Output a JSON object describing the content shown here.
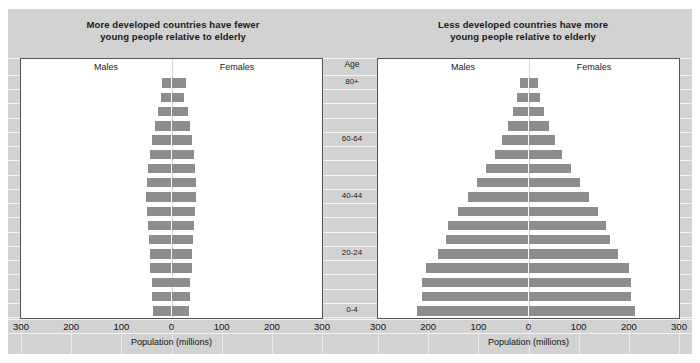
{
  "chart_data": {
    "type": "bar",
    "subtype": "population-pyramid",
    "panels": [
      {
        "id": "more-developed",
        "title_line1": "More developed countries have fewer",
        "title_line2": "young people relative to elderly",
        "male_label": "Males",
        "female_label": "Females",
        "xlabel": "Population (millions)",
        "xlim": [
          -300,
          300
        ],
        "xticks": [
          300,
          200,
          100,
          0,
          100,
          200,
          300
        ],
        "categories": [
          "0-4",
          "5-9",
          "10-14",
          "15-19",
          "20-24",
          "25-29",
          "30-34",
          "35-39",
          "40-44",
          "45-49",
          "50-54",
          "55-59",
          "60-64",
          "65-69",
          "70-74",
          "75-79",
          "80+"
        ],
        "series": [
          {
            "name": "Males",
            "values": [
              36,
              38,
              39,
              42,
              43,
              44,
              46,
              48,
              50,
              48,
              46,
              42,
              38,
              32,
              27,
              20,
              19
            ]
          },
          {
            "name": "Females",
            "values": [
              34,
              36,
              37,
              40,
              41,
              42,
              44,
              46,
              49,
              48,
              47,
              44,
              41,
              36,
              32,
              25,
              28
            ]
          }
        ]
      },
      {
        "id": "less-developed",
        "title_line1": "Less developed countries have more",
        "title_line2": "young people relative to elderly",
        "male_label": "Males",
        "female_label": "Females",
        "xlabel": "Population (millions)",
        "xlim": [
          -300,
          300
        ],
        "xticks": [
          300,
          200,
          100,
          0,
          100,
          200,
          300
        ],
        "categories": [
          "0-4",
          "5-9",
          "10-14",
          "15-19",
          "20-24",
          "25-29",
          "30-34",
          "35-39",
          "40-44",
          "45-49",
          "50-54",
          "55-59",
          "60-64",
          "65-69",
          "70-74",
          "75-79",
          "80+"
        ],
        "series": [
          {
            "name": "Males",
            "values": [
              222,
              212,
              212,
              205,
              180,
              165,
              160,
              140,
              120,
              103,
              85,
              67,
              52,
              40,
              30,
              22,
              17
            ]
          },
          {
            "name": "Females",
            "values": [
              213,
              205,
              205,
              200,
              178,
              163,
              155,
              138,
              120,
              103,
              84,
              66,
              52,
              40,
              30,
              22,
              19
            ]
          }
        ]
      }
    ],
    "age_axis": {
      "header": "Age",
      "labeled_ticks": [
        "0-4",
        "20-24",
        "40-44",
        "60-64",
        "80+"
      ]
    },
    "colors": {
      "bar": "#8d8d8d",
      "panel_background": "#d2d2d2",
      "plot_background": "#ffffff",
      "gridline": "#f4f4f4",
      "plot_border": "#555555",
      "text": "#1a1a1a"
    }
  }
}
